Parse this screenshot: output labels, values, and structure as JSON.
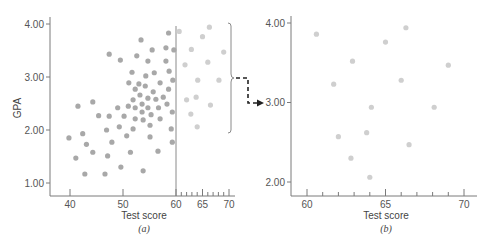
{
  "chart_data": [
    {
      "panel": "a",
      "type": "scatter",
      "title": "",
      "caption": "(a)",
      "xlabel": "Test score",
      "ylabel": "GPA",
      "xlim": [
        37,
        71
      ],
      "ylim": [
        0.8,
        4.1
      ],
      "xticks": [
        40,
        50,
        60,
        65,
        70
      ],
      "xtick_labels": [
        "40",
        "50",
        "60",
        "65",
        "70"
      ],
      "yticks": [
        1.0,
        2.0,
        3.0,
        4.0
      ],
      "ytick_labels": [
        "1.00",
        "2.00",
        "3.00",
        "4.00"
      ],
      "grid": false,
      "cutoff_line_x": 60,
      "annotation": "Bracket grouping points with test score above 60, linked by dashed arrow to panel (b)",
      "series": [
        {
          "name": "Test score below 60",
          "color": "#a8a8a8",
          "points": [
            [
              39.8,
              1.85
            ],
            [
              41.1,
              1.47
            ],
            [
              41.5,
              2.45
            ],
            [
              42.4,
              1.93
            ],
            [
              42.8,
              1.17
            ],
            [
              43.1,
              1.73
            ],
            [
              44.3,
              2.53
            ],
            [
              44.3,
              1.58
            ],
            [
              45.4,
              2.27
            ],
            [
              46.6,
              1.17
            ],
            [
              46.9,
              2.0
            ],
            [
              47.1,
              1.51
            ],
            [
              47.4,
              3.43
            ],
            [
              47.4,
              2.26
            ],
            [
              47.9,
              1.77
            ],
            [
              49.0,
              2.42
            ],
            [
              49.3,
              2.06
            ],
            [
              49.5,
              3.32
            ],
            [
              49.6,
              1.3
            ],
            [
              50.2,
              2.26
            ],
            [
              50.7,
              1.89
            ],
            [
              51.0,
              2.45
            ],
            [
              51.1,
              2.89
            ],
            [
              51.4,
              1.58
            ],
            [
              51.7,
              3.09
            ],
            [
              51.9,
              2.02
            ],
            [
              51.9,
              2.57
            ],
            [
              52.3,
              2.21
            ],
            [
              52.3,
              2.42
            ],
            [
              52.3,
              2.77
            ],
            [
              52.6,
              3.4
            ],
            [
              53.0,
              2.87
            ],
            [
              53.2,
              2.66
            ],
            [
              53.4,
              3.7
            ],
            [
              53.6,
              2.49
            ],
            [
              53.6,
              2.34
            ],
            [
              53.8,
              1.23
            ],
            [
              53.8,
              2.19
            ],
            [
              54.2,
              2.83
            ],
            [
              54.3,
              3.02
            ],
            [
              54.7,
              2.42
            ],
            [
              54.7,
              2.6
            ],
            [
              54.7,
              3.3
            ],
            [
              55.1,
              1.87
            ],
            [
              55.1,
              2.09
            ],
            [
              55.3,
              2.29
            ],
            [
              55.5,
              3.51
            ],
            [
              55.7,
              2.72
            ],
            [
              55.9,
              3.08
            ],
            [
              56.2,
              2.58
            ],
            [
              56.6,
              1.6
            ],
            [
              56.7,
              2.42
            ],
            [
              57.0,
              2.21
            ],
            [
              57.0,
              2.89
            ],
            [
              57.6,
              2.62
            ],
            [
              58.1,
              3.3
            ],
            [
              58.1,
              3.55
            ],
            [
              58.3,
              2.49
            ],
            [
              58.6,
              2.77
            ],
            [
              58.6,
              3.83
            ],
            [
              58.7,
              3.11
            ],
            [
              59.1,
              2.02
            ],
            [
              59.3,
              2.34
            ],
            [
              59.3,
              1.77
            ],
            [
              59.4,
              2.94
            ],
            [
              59.6,
              3.51
            ]
          ]
        },
        {
          "name": "Test score above 60",
          "color": "#cfcfcf",
          "points": [
            [
              60.6,
              3.86
            ],
            [
              61.7,
              3.23
            ],
            [
              62.0,
              2.57
            ],
            [
              62.8,
              2.3
            ],
            [
              62.9,
              3.52
            ],
            [
              63.8,
              2.62
            ],
            [
              64.0,
              2.06
            ],
            [
              64.1,
              2.94
            ],
            [
              65.0,
              3.76
            ],
            [
              66.0,
              3.28
            ],
            [
              66.3,
              3.94
            ],
            [
              66.5,
              2.47
            ],
            [
              68.1,
              2.94
            ],
            [
              69.0,
              3.47
            ]
          ]
        }
      ]
    },
    {
      "panel": "b",
      "type": "scatter",
      "title": "",
      "caption": "(b)",
      "xlabel": "Test score",
      "ylabel": "",
      "xlim": [
        59,
        71
      ],
      "ylim": [
        1.8,
        4.1
      ],
      "xticks": [
        60,
        65,
        70
      ],
      "xtick_labels": [
        "60",
        "65",
        "70"
      ],
      "yticks": [
        2.0,
        3.0,
        4.0
      ],
      "ytick_labels": [
        "2.00",
        "3.00",
        "4.00"
      ],
      "grid": false,
      "series": [
        {
          "name": "Test score above 60 (enlarged)",
          "color": "#cfcfcf",
          "points": [
            [
              60.6,
              3.86
            ],
            [
              61.7,
              3.23
            ],
            [
              62.0,
              2.57
            ],
            [
              62.8,
              2.3
            ],
            [
              62.9,
              3.52
            ],
            [
              63.8,
              2.62
            ],
            [
              64.0,
              2.06
            ],
            [
              64.1,
              2.94
            ],
            [
              65.0,
              3.76
            ],
            [
              66.0,
              3.28
            ],
            [
              66.3,
              3.94
            ],
            [
              66.5,
              2.47
            ],
            [
              68.1,
              2.94
            ],
            [
              69.0,
              3.47
            ]
          ]
        }
      ]
    }
  ],
  "labels": {
    "a": {
      "ylabel": "GPA",
      "xlabel": "Test score",
      "caption": "(a)",
      "yticks": [
        "4.00",
        "3.00",
        "2.00",
        "1.00"
      ],
      "xticks": [
        "40",
        "50",
        "60",
        "65",
        "70"
      ]
    },
    "b": {
      "xlabel": "Test score",
      "caption": "(b)",
      "yticks": [
        "4.00",
        "3.00",
        "2.00"
      ],
      "xticks": [
        "60",
        "65",
        "70"
      ]
    }
  },
  "colors": {
    "axis": "#7a7a7a",
    "dot_dark": "#a8a8a8",
    "dot_light": "#cfcfcf",
    "arrow": "#222222"
  }
}
